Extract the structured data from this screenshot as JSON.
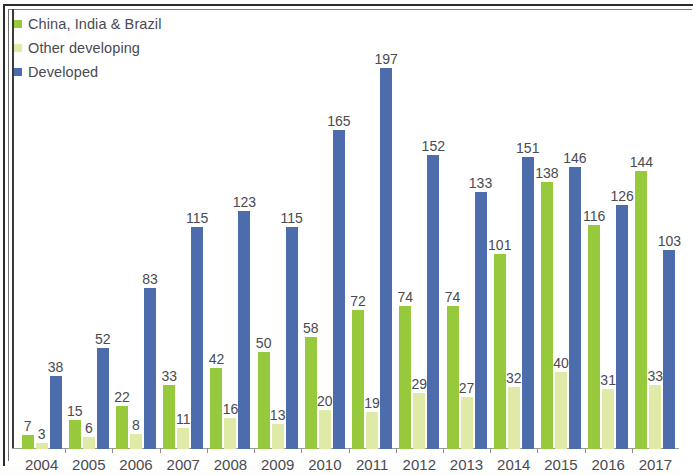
{
  "legend": {
    "items": [
      {
        "label": "China, India & Brazil",
        "color": "#97c93d",
        "key": "china_india_brazil"
      },
      {
        "label": "Other developing",
        "color": "#dfeaa6",
        "key": "other_developing"
      },
      {
        "label": "Developed",
        "color": "#4d6cab",
        "key": "developed"
      }
    ]
  },
  "chart_data": {
    "type": "bar",
    "title": "",
    "subtitle": "",
    "xlabel": "",
    "ylabel": "",
    "grid": false,
    "legend_position": "top-left",
    "ylim": [
      0,
      197
    ],
    "categories": [
      "2004",
      "2005",
      "2006",
      "2007",
      "2008",
      "2009",
      "2010",
      "2011",
      "2012",
      "2013",
      "2014",
      "2015",
      "2016",
      "2017"
    ],
    "series": [
      {
        "name": "China, India & Brazil",
        "color": "#97c93d",
        "values": [
          7,
          15,
          22,
          33,
          42,
          50,
          58,
          72,
          74,
          74,
          101,
          138,
          116,
          144
        ]
      },
      {
        "name": "Other developing",
        "color": "#dfeaa6",
        "values": [
          3,
          6,
          8,
          11,
          16,
          13,
          20,
          19,
          29,
          27,
          32,
          40,
          31,
          33
        ]
      },
      {
        "name": "Developed",
        "color": "#4d6cab",
        "values": [
          38,
          52,
          83,
          115,
          123,
          115,
          165,
          197,
          152,
          133,
          151,
          146,
          126,
          103
        ]
      }
    ],
    "data_labels": true
  }
}
